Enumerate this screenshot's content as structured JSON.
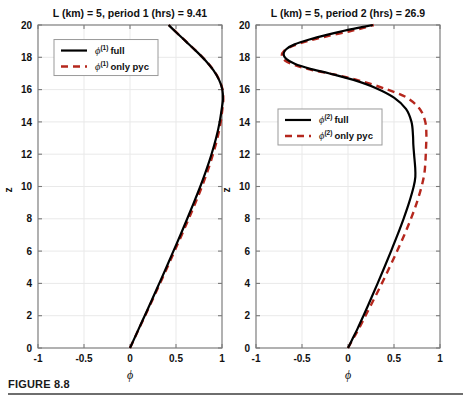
{
  "figure": {
    "caption_label": "FIGURE 8.8",
    "background": "#ffffff",
    "rule_color": "#6e6e6e"
  },
  "style": {
    "full_color": "#000000",
    "pyc_color": "#b5271d",
    "grid_color": "#e9e9e9",
    "axis_color": "#7a7a7a"
  },
  "chart_data": [
    {
      "type": "line",
      "panel": "left",
      "title": "L (km) = 5, period 1 (hrs) = 9.41",
      "xlabel": "ϕ",
      "ylabel": "z",
      "xlim": [
        -1,
        1
      ],
      "ylim": [
        0,
        20
      ],
      "xticks": [
        -1,
        -0.5,
        0,
        0.5,
        1
      ],
      "xticklabels": [
        "-1",
        "-0.5",
        "0",
        "0.5",
        "1"
      ],
      "yticks": [
        0,
        2,
        4,
        6,
        8,
        10,
        12,
        14,
        16,
        18,
        20
      ],
      "yticklabels": [
        "0",
        "2",
        "4",
        "6",
        "8",
        "10",
        "12",
        "14",
        "16",
        "18",
        "20"
      ],
      "grid": true,
      "legend_position": "upper-left",
      "legend": [
        {
          "label_symbol": "ϕ",
          "label_sup": "(1)",
          "label_text": "full",
          "style": "solid",
          "color": "#000000"
        },
        {
          "label_symbol": "ϕ",
          "label_sup": "(1)",
          "label_text": "only pyc",
          "style": "dashed",
          "color": "#b5271d"
        }
      ],
      "series": [
        {
          "name": "phi(1) full",
          "style": "solid",
          "color": "#000000",
          "points": [
            [
              0.0,
              0.0
            ],
            [
              0.08,
              1.0
            ],
            [
              0.16,
              2.0
            ],
            [
              0.24,
              3.0
            ],
            [
              0.318,
              4.0
            ],
            [
              0.396,
              5.0
            ],
            [
              0.472,
              6.0
            ],
            [
              0.548,
              7.0
            ],
            [
              0.622,
              8.0
            ],
            [
              0.694,
              9.0
            ],
            [
              0.764,
              10.0
            ],
            [
              0.828,
              11.0
            ],
            [
              0.886,
              12.0
            ],
            [
              0.936,
              13.0
            ],
            [
              0.975,
              14.0
            ],
            [
              1.002,
              15.0
            ],
            [
              1.01,
              15.4
            ],
            [
              1.004,
              16.0
            ],
            [
              0.968,
              16.6
            ],
            [
              0.906,
              17.2
            ],
            [
              0.82,
              17.8
            ],
            [
              0.716,
              18.4
            ],
            [
              0.604,
              19.0
            ],
            [
              0.492,
              19.6
            ],
            [
              0.42,
              20.0
            ]
          ]
        },
        {
          "name": "phi(1) only pyc",
          "style": "dashed",
          "color": "#b5271d",
          "points": [
            [
              0.0,
              0.0
            ],
            [
              0.082,
              1.0
            ],
            [
              0.164,
              2.0
            ],
            [
              0.246,
              3.0
            ],
            [
              0.326,
              4.0
            ],
            [
              0.406,
              5.0
            ],
            [
              0.484,
              6.0
            ],
            [
              0.562,
              7.0
            ],
            [
              0.638,
              8.0
            ],
            [
              0.712,
              9.0
            ],
            [
              0.782,
              10.0
            ],
            [
              0.846,
              11.0
            ],
            [
              0.902,
              12.0
            ],
            [
              0.95,
              13.0
            ],
            [
              0.986,
              14.0
            ],
            [
              1.008,
              15.0
            ],
            [
              1.014,
              15.4
            ],
            [
              1.006,
              16.0
            ],
            [
              0.97,
              16.6
            ],
            [
              0.908,
              17.2
            ],
            [
              0.822,
              17.8
            ],
            [
              0.718,
              18.4
            ],
            [
              0.606,
              19.0
            ],
            [
              0.494,
              19.6
            ],
            [
              0.422,
              20.0
            ]
          ]
        }
      ]
    },
    {
      "type": "line",
      "panel": "right",
      "title": "L (km) = 5, period 2 (hrs) = 26.9",
      "xlabel": "ϕ",
      "ylabel": "z",
      "xlim": [
        -1,
        1
      ],
      "ylim": [
        0,
        20
      ],
      "xticks": [
        -1,
        -0.5,
        0,
        0.5,
        1
      ],
      "xticklabels": [
        "-1",
        "-0.5",
        "0",
        "0.5",
        "1"
      ],
      "yticks": [
        0,
        2,
        4,
        6,
        8,
        10,
        12,
        14,
        16,
        18,
        20
      ],
      "yticklabels": [
        "0",
        "2",
        "4",
        "6",
        "8",
        "10",
        "12",
        "14",
        "16",
        "18",
        "20"
      ],
      "grid": true,
      "legend_position": "center-left",
      "legend": [
        {
          "label_symbol": "ϕ",
          "label_sup": "(2)",
          "label_text": "full",
          "style": "solid",
          "color": "#000000"
        },
        {
          "label_symbol": "ϕ",
          "label_sup": "(2)",
          "label_text": "only pyc",
          "style": "dashed",
          "color": "#b5271d"
        }
      ],
      "series": [
        {
          "name": "phi(2) full",
          "style": "solid",
          "color": "#000000",
          "points": [
            [
              0.0,
              0.0
            ],
            [
              0.052,
              0.6
            ],
            [
              0.104,
              1.2
            ],
            [
              0.168,
              2.0
            ],
            [
              0.246,
              3.0
            ],
            [
              0.322,
              4.0
            ],
            [
              0.396,
              5.0
            ],
            [
              0.468,
              6.0
            ],
            [
              0.538,
              7.0
            ],
            [
              0.604,
              8.0
            ],
            [
              0.664,
              9.0
            ],
            [
              0.714,
              10.0
            ],
            [
              0.732,
              10.6
            ],
            [
              0.73,
              11.2
            ],
            [
              0.718,
              12.0
            ],
            [
              0.71,
              12.6
            ],
            [
              0.706,
              13.2
            ],
            [
              0.69,
              14.0
            ],
            [
              0.63,
              14.8
            ],
            [
              0.5,
              15.5
            ],
            [
              0.3,
              16.1
            ],
            [
              0.06,
              16.6
            ],
            [
              -0.2,
              17.0
            ],
            [
              -0.42,
              17.3
            ],
            [
              -0.58,
              17.6
            ],
            [
              -0.672,
              17.9
            ],
            [
              -0.7,
              18.2
            ],
            [
              -0.672,
              18.5
            ],
            [
              -0.58,
              18.8
            ],
            [
              -0.42,
              19.1
            ],
            [
              -0.22,
              19.4
            ],
            [
              0.0,
              19.7
            ],
            [
              0.18,
              19.9
            ],
            [
              0.27,
              20.0
            ]
          ]
        },
        {
          "name": "phi(2) only pyc",
          "style": "dashed",
          "color": "#b5271d",
          "points": [
            [
              0.0,
              0.0
            ],
            [
              0.058,
              0.6
            ],
            [
              0.118,
              1.2
            ],
            [
              0.19,
              2.0
            ],
            [
              0.28,
              3.0
            ],
            [
              0.368,
              4.0
            ],
            [
              0.452,
              5.0
            ],
            [
              0.534,
              6.0
            ],
            [
              0.612,
              7.0
            ],
            [
              0.684,
              8.0
            ],
            [
              0.748,
              9.0
            ],
            [
              0.8,
              10.0
            ],
            [
              0.83,
              10.8
            ],
            [
              0.842,
              11.6
            ],
            [
              0.848,
              12.4
            ],
            [
              0.852,
              13.2
            ],
            [
              0.84,
              14.0
            ],
            [
              0.78,
              14.8
            ],
            [
              0.64,
              15.5
            ],
            [
              0.43,
              16.0
            ],
            [
              0.16,
              16.5
            ],
            [
              -0.12,
              16.9
            ],
            [
              -0.38,
              17.2
            ],
            [
              -0.57,
              17.5
            ],
            [
              -0.686,
              17.8
            ],
            [
              -0.72,
              18.1
            ],
            [
              -0.694,
              18.4
            ],
            [
              -0.6,
              18.7
            ],
            [
              -0.44,
              19.0
            ],
            [
              -0.23,
              19.3
            ],
            [
              0.01,
              19.6
            ],
            [
              0.19,
              19.85
            ],
            [
              0.28,
              20.0
            ]
          ]
        }
      ]
    }
  ]
}
